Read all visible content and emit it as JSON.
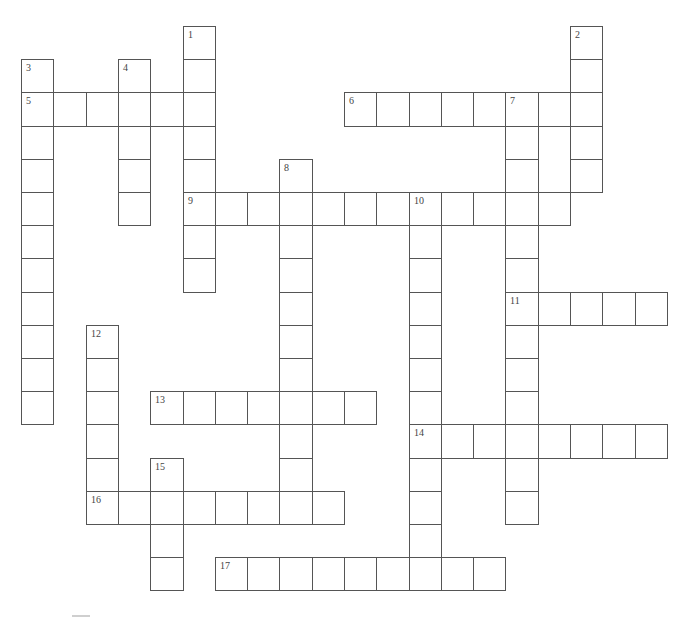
{
  "puzzle": {
    "type": "crossword",
    "grid_origin": {
      "x": 22,
      "y": 27
    },
    "cell_width": 32.3,
    "cell_height": 33.2,
    "line_color": "#555555",
    "number_color": "#444444",
    "words": [
      {
        "number": "1",
        "direction": "down",
        "col": 5,
        "row": 0,
        "length": 8
      },
      {
        "number": "2",
        "direction": "down",
        "col": 17,
        "row": 0,
        "length": 5
      },
      {
        "number": "3",
        "direction": "down",
        "col": 0,
        "row": 1,
        "length": 11
      },
      {
        "number": "4",
        "direction": "down",
        "col": 3,
        "row": 1,
        "length": 5
      },
      {
        "number": "5",
        "direction": "across",
        "col": 0,
        "row": 2,
        "length": 6
      },
      {
        "number": "6",
        "direction": "across",
        "col": 10,
        "row": 2,
        "length": 8
      },
      {
        "number": "7",
        "direction": "down",
        "col": 15,
        "row": 2,
        "length": 13
      },
      {
        "number": "8",
        "direction": "down",
        "col": 8,
        "row": 4,
        "length": 11
      },
      {
        "number": "9",
        "direction": "across",
        "col": 5,
        "row": 5,
        "length": 12
      },
      {
        "number": "10",
        "direction": "down",
        "col": 12,
        "row": 5,
        "length": 12
      },
      {
        "number": "11",
        "direction": "across",
        "col": 15,
        "row": 8,
        "length": 5
      },
      {
        "number": "12",
        "direction": "down",
        "col": 2,
        "row": 9,
        "length": 6
      },
      {
        "number": "13",
        "direction": "across",
        "col": 4,
        "row": 11,
        "length": 7
      },
      {
        "number": "14",
        "direction": "across",
        "col": 12,
        "row": 12,
        "length": 8
      },
      {
        "number": "15",
        "direction": "down",
        "col": 4,
        "row": 13,
        "length": 4
      },
      {
        "number": "16",
        "direction": "across",
        "col": 2,
        "row": 14,
        "length": 8
      },
      {
        "number": "17",
        "direction": "across",
        "col": 6,
        "row": 16,
        "length": 9
      }
    ]
  }
}
